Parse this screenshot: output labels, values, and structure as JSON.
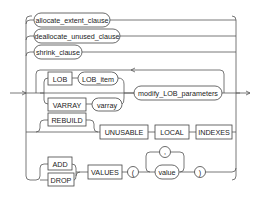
{
  "diagram": {
    "type": "railroad-syntax",
    "nodes": {
      "allocate_extent_clause": "allocate_extent_clause",
      "deallocate_unused_clause": "deallocate_unused_clause",
      "shrink_clause": "shrink_clause",
      "lob_kw": "LOB",
      "lob_item": "LOB_item",
      "varray_kw": "VARRAY",
      "varray": "varray",
      "modify_lob_parameters": "modify_LOB_parameters",
      "rebuild_kw": "REBUILD",
      "unusable_kw": "UNUSABLE",
      "local_kw": "LOCAL",
      "indexes_kw": "INDEXES",
      "add_kw": "ADD",
      "drop_kw": "DROP",
      "values_kw": "VALUES",
      "lparen": "(",
      "comma": ",",
      "value": "value",
      "rparen": ")"
    }
  }
}
